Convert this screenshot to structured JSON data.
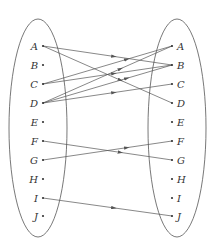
{
  "diagram": {
    "type": "mapping",
    "left_set": {
      "elements": [
        {
          "label": "A",
          "y": 46
        },
        {
          "label": "B",
          "y": 65
        },
        {
          "label": "C",
          "y": 84
        },
        {
          "label": "D",
          "y": 103
        },
        {
          "label": "E",
          "y": 122
        },
        {
          "label": "F",
          "y": 141
        },
        {
          "label": "G",
          "y": 160
        },
        {
          "label": "H",
          "y": 179
        },
        {
          "label": "I",
          "y": 198
        },
        {
          "label": "J",
          "y": 216
        }
      ]
    },
    "right_set": {
      "elements": [
        {
          "label": "A",
          "y": 46
        },
        {
          "label": "B",
          "y": 65
        },
        {
          "label": "C",
          "y": 84
        },
        {
          "label": "D",
          "y": 103
        },
        {
          "label": "E",
          "y": 122
        },
        {
          "label": "F",
          "y": 141
        },
        {
          "label": "G",
          "y": 160
        },
        {
          "label": "H",
          "y": 179
        },
        {
          "label": "I",
          "y": 198
        },
        {
          "label": "J",
          "y": 216
        }
      ]
    },
    "arrows": [
      {
        "from": "A",
        "to": "B"
      },
      {
        "from": "A",
        "to": "D"
      },
      {
        "from": "C",
        "to": "A"
      },
      {
        "from": "C",
        "to": "B"
      },
      {
        "from": "D",
        "to": "A"
      },
      {
        "from": "D",
        "to": "B"
      },
      {
        "from": "D",
        "to": "C"
      },
      {
        "from": "F",
        "to": "G"
      },
      {
        "from": "G",
        "to": "F"
      },
      {
        "from": "I",
        "to": "J"
      }
    ],
    "colors": {
      "line": "#555555",
      "text": "#333333"
    }
  }
}
